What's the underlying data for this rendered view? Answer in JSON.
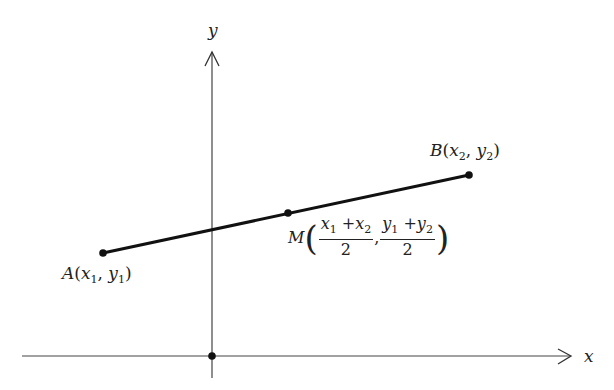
{
  "axes": {
    "x_label": "x",
    "y_label": "y",
    "origin": {
      "x": 212,
      "y": 356
    }
  },
  "points": {
    "A": {
      "name": "A",
      "label_x": "x",
      "label_y": "y",
      "sub": "1",
      "px": 103,
      "py": 253
    },
    "B": {
      "name": "B",
      "label_x": "x",
      "label_y": "y",
      "sub": "2",
      "px": 469,
      "py": 175
    },
    "M": {
      "name": "M",
      "px": 288,
      "py": 213,
      "num_x": "x",
      "sub1": "1",
      "plus": "+",
      "num_x2": "x",
      "sub2": "2",
      "num_y": "y",
      "num_y2": "y",
      "den": "2",
      "comma": ","
    }
  },
  "labels": {
    "open_paren": "(",
    "close_paren": ")",
    "comma": ", "
  },
  "colors": {
    "line": "#111111",
    "axis": "#333333",
    "text": "#222222"
  }
}
